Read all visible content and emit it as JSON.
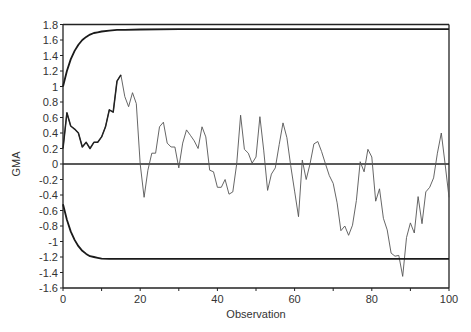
{
  "chart_data": {
    "type": "line",
    "title": "",
    "xlabel": "Observation",
    "ylabel": "GMA",
    "xlim": [
      0,
      100
    ],
    "ylim": [
      -1.6,
      1.8
    ],
    "x_ticks": [
      0,
      20,
      40,
      60,
      80,
      100
    ],
    "x_tick_labels": [
      "0",
      "20",
      "40",
      "60",
      "80",
      "100"
    ],
    "y_ticks": [
      1.8,
      1.6,
      1.4,
      1.2,
      1,
      0.8,
      0.6,
      0.4,
      0.2,
      0,
      -0.2,
      -0.4,
      -0.6,
      -0.8,
      -1,
      -1.2,
      -1.4,
      -1.6
    ],
    "y_tick_labels": [
      "1.8",
      "1.6",
      "1.4",
      "1.2",
      "1",
      "0.8",
      "0.6",
      "0.4",
      "0.2",
      "0",
      "-0.2",
      "-0.4",
      "-0.6",
      "-0.8",
      "-1",
      "-1.2",
      "-1.4",
      "-1.6"
    ],
    "grid": false,
    "legend": null,
    "reference_line": {
      "y": 0
    },
    "series": [
      {
        "name": "GMA",
        "style": "thin",
        "x": [
          0,
          1,
          2,
          3,
          4,
          5,
          6,
          7,
          8,
          9,
          10,
          11,
          12,
          13,
          14,
          15,
          16,
          17,
          18,
          19,
          20,
          21,
          22,
          23,
          24,
          25,
          26,
          27,
          28,
          29,
          30,
          31,
          32,
          33,
          34,
          35,
          36,
          37,
          38,
          39,
          40,
          41,
          42,
          43,
          44,
          45,
          46,
          47,
          48,
          49,
          50,
          51,
          52,
          53,
          54,
          55,
          56,
          57,
          58,
          59,
          60,
          61,
          62,
          63,
          64,
          65,
          66,
          67,
          68,
          69,
          70,
          71,
          72,
          73,
          74,
          75,
          76,
          77,
          78,
          79,
          80,
          81,
          82,
          83,
          84,
          85,
          86,
          87,
          88,
          89,
          90,
          91,
          92,
          93,
          94,
          95,
          96,
          97,
          98,
          99,
          100
        ],
        "values": [
          0.2,
          0.66,
          0.49,
          0.45,
          0.4,
          0.22,
          0.28,
          0.2,
          0.28,
          0.28,
          0.35,
          0.48,
          0.7,
          0.67,
          1.07,
          1.15,
          0.87,
          0.74,
          0.92,
          0.78,
          0.0,
          -0.43,
          -0.08,
          0.14,
          0.14,
          0.48,
          0.54,
          0.27,
          0.22,
          0.22,
          -0.05,
          0.27,
          0.44,
          0.37,
          0.3,
          0.2,
          0.48,
          0.35,
          -0.08,
          -0.1,
          -0.3,
          -0.3,
          -0.2,
          -0.39,
          -0.36,
          0.0,
          0.63,
          0.19,
          0.14,
          0.01,
          0.09,
          0.61,
          0.18,
          -0.34,
          -0.13,
          -0.05,
          0.25,
          0.53,
          0.34,
          -0.02,
          -0.35,
          -0.68,
          0.05,
          -0.2,
          0.0,
          0.26,
          0.29,
          0.16,
          0.0,
          -0.15,
          -0.25,
          -0.5,
          -0.86,
          -0.8,
          -0.92,
          -0.79,
          -0.47,
          0.03,
          -0.1,
          0.19,
          0.09,
          -0.48,
          -0.32,
          -0.7,
          -0.85,
          -1.15,
          -1.19,
          -1.18,
          -1.45,
          -0.95,
          -0.76,
          -0.89,
          -0.42,
          -0.77,
          -0.36,
          -0.3,
          -0.18,
          0.14,
          0.4,
          0.0,
          -0.43
        ]
      },
      {
        "name": "Upper control limit",
        "style": "thick",
        "x": [
          0,
          1,
          2,
          3,
          4,
          5,
          6,
          7,
          8,
          9,
          10,
          12,
          14,
          16,
          20,
          30,
          40,
          60,
          80,
          100
        ],
        "values": [
          1.0,
          1.2,
          1.35,
          1.46,
          1.54,
          1.6,
          1.64,
          1.67,
          1.69,
          1.7,
          1.71,
          1.72,
          1.73,
          1.73,
          1.735,
          1.74,
          1.74,
          1.74,
          1.74,
          1.74
        ]
      },
      {
        "name": "Lower control limit",
        "style": "thick",
        "x": [
          0,
          1,
          2,
          3,
          4,
          5,
          6,
          7,
          8,
          9,
          10,
          12,
          14,
          16,
          20,
          30,
          40,
          60,
          80,
          100
        ],
        "values": [
          -0.52,
          -0.72,
          -0.87,
          -0.98,
          -1.06,
          -1.12,
          -1.16,
          -1.19,
          -1.2,
          -1.21,
          -1.22,
          -1.225,
          -1.225,
          -1.225,
          -1.225,
          -1.225,
          -1.225,
          -1.225,
          -1.225,
          -1.225
        ]
      }
    ]
  }
}
